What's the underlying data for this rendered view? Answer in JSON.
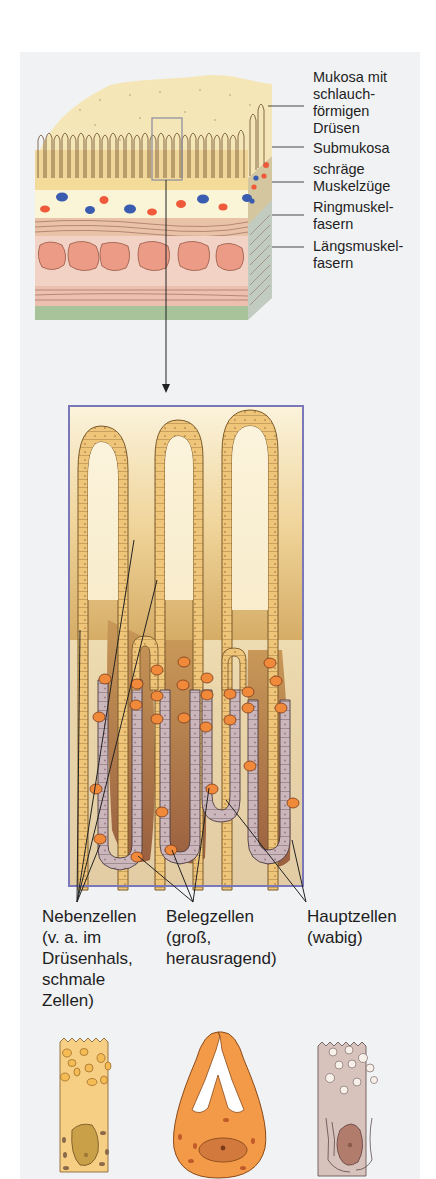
{
  "figure": {
    "wall_labels": [
      {
        "id": "mukosa",
        "lines": [
          "Mukosa mit",
          "schlauch-",
          "förmigen",
          "Drüsen"
        ]
      },
      {
        "id": "submukosa",
        "lines": [
          "Submukosa"
        ]
      },
      {
        "id": "schraege",
        "lines": [
          "schräge",
          "Muskelzüge"
        ]
      },
      {
        "id": "ring",
        "lines": [
          "Ringmuskel-",
          "fasern"
        ]
      },
      {
        "id": "laengs",
        "lines": [
          "Längsmuskel-",
          "fasern"
        ]
      }
    ],
    "cell_labels": [
      {
        "id": "nebenzellen",
        "lines": [
          "Nebenzellen",
          "(v. a. im",
          "Drüsenhals,",
          "schmale",
          "Zellen)"
        ]
      },
      {
        "id": "belegzellen",
        "lines": [
          "Belegzellen",
          "(groß,",
          "herausragend)"
        ]
      },
      {
        "id": "hauptzellen",
        "lines": [
          "Hauptzellen",
          "(wabig)"
        ]
      }
    ],
    "colors": {
      "panel_bg": "#f1f2f4",
      "mucosa": "#f3dfa8",
      "gland_cell": "#ecc070",
      "submucosa": "#fbf5d8",
      "vessel_red": "#ee5a3a",
      "vessel_blue": "#3a5cb0",
      "muscle": "#e8a88e",
      "serosa": "#a8c29a",
      "box_border": "#7a78b8",
      "gland_dark": "#a06a3a",
      "chief_cell": "#c8b4b8",
      "parietal_cell": "#f08a3a"
    }
  }
}
